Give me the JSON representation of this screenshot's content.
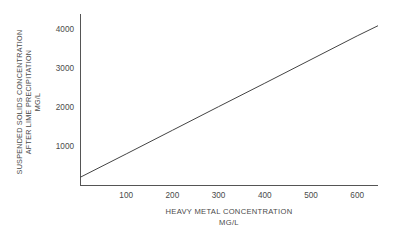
{
  "chart_data": {
    "type": "line",
    "title": "",
    "subtitle": "",
    "xlabel": "HEAVY METAL CONCENTRATION",
    "xlabel_units": "MG/L",
    "ylabel": "SUSPENDED SOLIDS CONCENTRATION",
    "ylabel_line2": "AFTER LIME PRECIPITATION",
    "ylabel_units": "MG/L",
    "xlim": [
      0,
      645
    ],
    "ylim": [
      0,
      4400
    ],
    "xticks": [
      100,
      200,
      300,
      400,
      500,
      600
    ],
    "xtick_labels": [
      "100",
      "200",
      "300",
      "400",
      "500",
      "600"
    ],
    "yticks": [
      1000,
      2000,
      3000,
      4000
    ],
    "ytick_labels": [
      "1000",
      "2000",
      "3000",
      "4000"
    ],
    "grid": false,
    "legend": null,
    "series": [
      {
        "name": "suspended solids vs heavy metal",
        "x": [
          0,
          100,
          200,
          300,
          400,
          500,
          600,
          645
        ],
        "y": [
          220,
          820,
          1425,
          2030,
          2630,
          3235,
          3840,
          4100
        ],
        "color": "#444444",
        "linewidth": 1
      }
    ],
    "colors": {
      "axis": "#555555",
      "line": "#444444",
      "text": "#4a4a4a",
      "background": "#ffffff"
    }
  },
  "axis_titles": {
    "y_lines": [
      "SUSPENDED SOLIDS CONCENTRATION",
      "AFTER LIME PRECIPITATION",
      "MG/L"
    ],
    "x_lines": [
      "HEAVY METAL CONCENTRATION",
      "MG/L"
    ]
  }
}
